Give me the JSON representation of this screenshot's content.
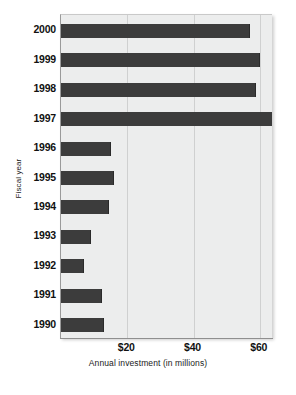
{
  "chart_data": {
    "type": "bar",
    "orientation": "horizontal",
    "title": "",
    "xlabel": "Annual investment (in millions)",
    "ylabel": "Fiscal year",
    "categories": [
      "2000",
      "1999",
      "1998",
      "1997",
      "1996",
      "1995",
      "1994",
      "1993",
      "1992",
      "1991",
      "1990"
    ],
    "values": [
      57,
      60,
      59,
      74,
      15,
      16,
      14.5,
      9,
      7,
      12.5,
      13
    ],
    "xlim": [
      0,
      80
    ],
    "xticks": [
      20,
      40,
      60,
      80
    ],
    "xtick_labels": [
      "$20",
      "$40",
      "$60",
      "$80"
    ],
    "grid": "vertical",
    "legend": "none",
    "series": [
      {
        "name": "Annual investment",
        "color": "#3c3c3c",
        "points": [
          {
            "category": "2000",
            "value": 57
          },
          {
            "category": "1999",
            "value": 60
          },
          {
            "category": "1998",
            "value": 59
          },
          {
            "category": "1997",
            "value": 74
          },
          {
            "category": "1996",
            "value": 15
          },
          {
            "category": "1995",
            "value": 16
          },
          {
            "category": "1994",
            "value": 14.5
          },
          {
            "category": "1993",
            "value": 9
          },
          {
            "category": "1992",
            "value": 7
          },
          {
            "category": "1991",
            "value": 12.5
          },
          {
            "category": "1990",
            "value": 13
          }
        ]
      }
    ]
  },
  "colors": {
    "bar": "#3c3c3c",
    "plot_background": "#eceded",
    "gridline": "#cfd0d0",
    "axis": "#8f8f8f",
    "text": "#111111"
  }
}
